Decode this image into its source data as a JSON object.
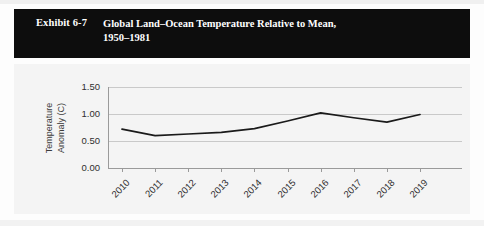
{
  "exhibit": {
    "label": "Exhibit 6-7",
    "title_line1": "Global Land–Ocean Temperature Relative to Mean,",
    "title_line2": "1950–1981",
    "bar_color": "#0d0d0d",
    "text_color": "#ffffff"
  },
  "chart_data": {
    "type": "line",
    "title": "Global Land–Ocean Temperature Relative to Mean, 1950–1981",
    "xlabel": "",
    "ylabel": "Temperature Anomaly (C)",
    "ylabel_line1": "Temperature",
    "ylabel_line2": "Anomaly (C)",
    "categories": [
      "2010",
      "2011",
      "2012",
      "2013",
      "2014",
      "2015",
      "2016",
      "2017",
      "2018",
      "2019"
    ],
    "values": [
      0.72,
      0.6,
      0.63,
      0.66,
      0.73,
      0.87,
      1.02,
      0.93,
      0.85,
      0.99
    ],
    "series": [
      {
        "name": "Temperature Anomaly (C)",
        "values": [
          0.72,
          0.6,
          0.63,
          0.66,
          0.73,
          0.87,
          1.02,
          0.93,
          0.85,
          0.99
        ],
        "color": "#1a1a1a"
      }
    ],
    "ylim": [
      0.0,
      1.5
    ],
    "yticks": [
      1.5,
      1.0,
      0.5,
      0.0
    ],
    "ytick_labels": [
      "1.50",
      "1.00",
      "0.50",
      "0.00"
    ],
    "grid": true,
    "legend": false,
    "legend_position": "none",
    "line_color": "#1a1a1a",
    "plot_background": "#f4f4f4",
    "gridline_color": "#c9c9c9",
    "axis_color": "#9a9a9a"
  }
}
